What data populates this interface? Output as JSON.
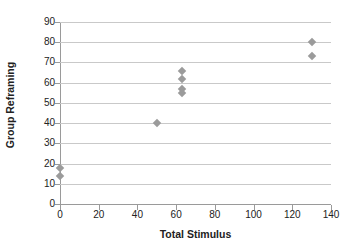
{
  "chart_data": {
    "type": "scatter",
    "title": "",
    "xlabel": "Total Stimulus",
    "ylabel": "Group Reframing",
    "xlim": [
      0,
      140
    ],
    "ylim": [
      0,
      90
    ],
    "xticks": [
      0,
      20,
      40,
      60,
      80,
      100,
      120,
      140
    ],
    "yticks": [
      0,
      10,
      20,
      30,
      40,
      50,
      60,
      70,
      80,
      90
    ],
    "grid": "horizontal",
    "legend": "none",
    "marker": "diamond",
    "marker_color": "#9b9b9b",
    "series": [
      {
        "name": "Group Reframing",
        "points": [
          {
            "x": 0,
            "y": 18
          },
          {
            "x": 0,
            "y": 14
          },
          {
            "x": 50,
            "y": 40
          },
          {
            "x": 63,
            "y": 66
          },
          {
            "x": 63,
            "y": 62
          },
          {
            "x": 63,
            "y": 57
          },
          {
            "x": 63,
            "y": 55
          },
          {
            "x": 130,
            "y": 80
          },
          {
            "x": 130,
            "y": 73
          }
        ]
      }
    ]
  },
  "axes": {
    "x_title": "Total Stimulus",
    "y_title": "Group Reframing",
    "x_tick_labels": [
      "0",
      "20",
      "40",
      "60",
      "80",
      "100",
      "120",
      "140"
    ],
    "y_tick_labels": [
      "0",
      "10",
      "20",
      "30",
      "40",
      "50",
      "60",
      "70",
      "80",
      "90"
    ]
  },
  "colors": {
    "marker": "#9b9b9b",
    "gridline": "#c9c9c9",
    "axis": "#9a9a9a",
    "text": "#222222",
    "background": "#ffffff"
  }
}
